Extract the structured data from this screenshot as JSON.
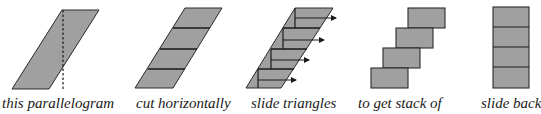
{
  "colors": {
    "fill": "#a0a0a0",
    "stroke": "#2a2a2a",
    "text": "#1a1a1a"
  },
  "steps": [
    {
      "id": "step1",
      "label": "this parallelogram",
      "description": "parallelogram with dashed vertical line"
    },
    {
      "id": "step2",
      "label": "cut horizontally",
      "description": "parallelogram cut into 4 horizontal strips"
    },
    {
      "id": "step3",
      "label": "slide triangles",
      "description": "triangles in each strip slid right (arrows)"
    },
    {
      "id": "step4",
      "label": "to get stack of",
      "description": "staircase of 4 rectangles"
    },
    {
      "id": "step5",
      "label": "slide back",
      "description": "4 rectangles stacked vertically"
    }
  ]
}
